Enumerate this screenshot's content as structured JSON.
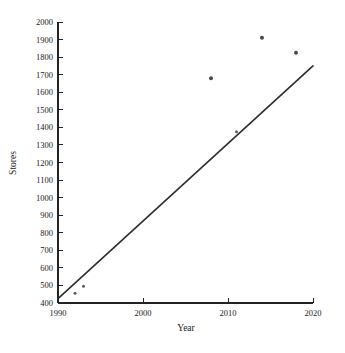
{
  "chart_data": {
    "type": "scatter",
    "title": "",
    "subtitle": "",
    "xlabel": "Year",
    "ylabel": "Stores",
    "xlim": [
      1990,
      2020
    ],
    "ylim": [
      400,
      2000
    ],
    "xticks": [
      1990,
      2000,
      2010,
      2020
    ],
    "yticks": [
      400,
      500,
      600,
      700,
      800,
      900,
      1000,
      1100,
      1200,
      1300,
      1400,
      1500,
      1600,
      1700,
      1800,
      1900,
      2000
    ],
    "xtick_labels": [
      "1990",
      "2000",
      "2010",
      "2020"
    ],
    "ytick_labels": [
      "400",
      "500",
      "600",
      "700",
      "800",
      "900",
      "1000",
      "1100",
      "1200",
      "1300",
      "1400",
      "1500",
      "1600",
      "1700",
      "1800",
      "1900",
      "2000"
    ],
    "grid": false,
    "legend": false,
    "legend_position": "none",
    "series": [
      {
        "name": "Stores",
        "type": "scatter",
        "marker": "circle",
        "color": "#4a4a4a",
        "points": [
          {
            "x": 1992,
            "y": 455
          },
          {
            "x": 1993,
            "y": 495
          },
          {
            "x": 2008,
            "y": 1680
          },
          {
            "x": 2011,
            "y": 1375
          },
          {
            "x": 2014,
            "y": 1910
          },
          {
            "x": 2018,
            "y": 1825
          }
        ]
      },
      {
        "name": "Trend line",
        "type": "line",
        "color": "#2d2d2d",
        "points": [
          {
            "x": 1990,
            "y": 425
          },
          {
            "x": 2020,
            "y": 1750
          }
        ]
      }
    ],
    "annotations": []
  },
  "axes": {
    "x_axis_label": "Year",
    "y_axis_label": "Stores"
  }
}
